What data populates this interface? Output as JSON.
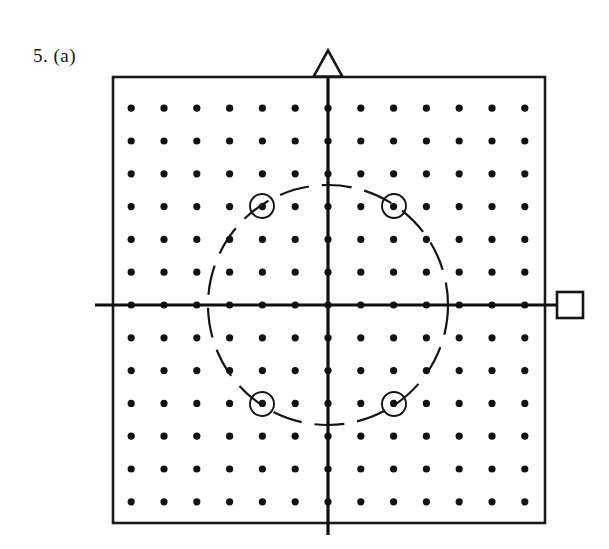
{
  "figure": {
    "label": "5. (a)",
    "caption_number": "5",
    "caption_part": "(a)"
  },
  "panel": {
    "x": 113,
    "y": 77,
    "width": 432,
    "height": 446,
    "border_color": "#1a1a1a",
    "background_color": "#ffffff"
  },
  "markers": {
    "triangle": {
      "name": "triangle-marker",
      "shape": "triangle",
      "cx": 328,
      "cy": 64,
      "size": 26,
      "filled": false,
      "position": "top-center-above-border"
    },
    "square": {
      "name": "square-marker",
      "shape": "square",
      "cx": 570,
      "cy": 305,
      "size": 26,
      "filled": false,
      "position": "right-middle-outside-border"
    }
  },
  "chart_data": {
    "type": "scatter",
    "title": "5. (a)",
    "xlabel": "",
    "ylabel": "",
    "grid": false,
    "legend": "none",
    "lattice": {
      "rows": 13,
      "cols": 13,
      "spacing_px": 32.8,
      "origin_index": [
        6,
        6
      ],
      "origin_px": [
        328,
        305
      ],
      "dot_radius_px": 3.6,
      "dot_color": "#121212",
      "x_indices": [
        -6,
        -5,
        -4,
        -3,
        -2,
        -1,
        0,
        1,
        2,
        3,
        4,
        5,
        6
      ],
      "y_indices": [
        -6,
        -5,
        -4,
        -3,
        -2,
        -1,
        0,
        1,
        2,
        3,
        4,
        5,
        6
      ]
    },
    "axes": {
      "horizontal": {
        "y_px": 305,
        "x_start_px": 95,
        "x_end_px": 563,
        "color": "#101010",
        "width_px": 3.2
      },
      "vertical": {
        "x_px": 328,
        "y_start_px": 70,
        "y_end_px": 535,
        "color": "#101010",
        "width_px": 3.2
      }
    },
    "circle": {
      "center_px": [
        328,
        305
      ],
      "radius_px": 120,
      "radius_lattice_units": 3.66,
      "style": "dashed",
      "dash_pattern": "30 13",
      "color": "#141414"
    },
    "highlighted_points": [
      {
        "label": "top-left",
        "lattice": [
          -2,
          3
        ],
        "px": [
          262,
          206
        ]
      },
      {
        "label": "top-right",
        "lattice": [
          2,
          3
        ],
        "px": [
          394,
          206
        ]
      },
      {
        "label": "bottom-left",
        "lattice": [
          -2,
          -3
        ],
        "px": [
          262,
          404
        ]
      },
      {
        "label": "bottom-right",
        "lattice": [
          2,
          -3
        ],
        "px": [
          394,
          404
        ]
      }
    ],
    "highlight_ring_radius_px": 12
  }
}
